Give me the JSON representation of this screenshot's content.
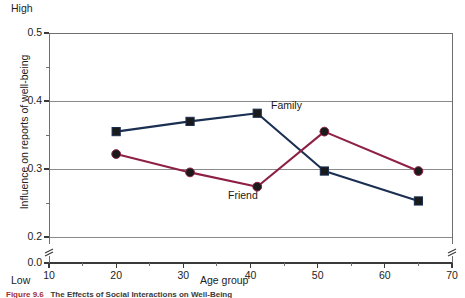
{
  "figure": {
    "high_label": "High",
    "low_label": "Low",
    "caption_number": "Figure 9.6",
    "caption_text": "The Effects of Social Interactions on Well-Being"
  },
  "chart_data": {
    "type": "line",
    "title": "",
    "xlabel": "Age group",
    "ylabel": "Influence on reports of well-being",
    "xlim": [
      10,
      70
    ],
    "ylim": [
      0.2,
      0.5
    ],
    "y_axis_break": true,
    "y_break_value": "0.0",
    "x_axis_break": true,
    "grid": true,
    "grid_axis": "y",
    "legend": "inline-annotation",
    "x_ticks": [
      "10",
      "20",
      "30",
      "40",
      "50",
      "60",
      "70"
    ],
    "x_tick_values": [
      10,
      20,
      30,
      40,
      50,
      60,
      70
    ],
    "y_ticks": [
      "0.5",
      "0.4",
      "0.3",
      "0.2",
      "0.0"
    ],
    "y_tick_values": [
      0.5,
      0.4,
      0.3,
      0.2,
      0.0
    ],
    "y_minor_ticks": [
      0.45,
      0.35,
      0.25
    ],
    "x": [
      20,
      31,
      41,
      51,
      65
    ],
    "series": [
      {
        "name": "Family",
        "color": "#1b2f52",
        "marker": "square",
        "values": [
          0.355,
          0.37,
          0.382,
          0.297,
          0.253
        ]
      },
      {
        "name": "Friend",
        "color": "#8e1f45",
        "marker": "circle",
        "values": [
          0.322,
          0.295,
          0.274,
          0.355,
          0.297
        ]
      }
    ],
    "annotations": [
      {
        "text": "Family",
        "x": 44,
        "y": 0.385
      },
      {
        "text": "Friend",
        "x": 36,
        "y": 0.245
      }
    ]
  }
}
